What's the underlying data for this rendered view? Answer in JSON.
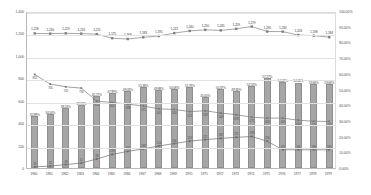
{
  "chart_data": {
    "type": "bar",
    "title": "",
    "xlabel": "",
    "ylabel": "",
    "ylim": [
      0,
      1400
    ],
    "y2lim": [
      0,
      100
    ],
    "grid": true,
    "legend": "none",
    "categories": [
      "1960",
      "1961",
      "1962",
      "1963",
      "1964",
      "1965",
      "1966",
      "1967",
      "1968",
      "1969",
      "1970",
      "1971",
      "1972",
      "1973",
      "1974",
      "1975",
      "1976",
      "1977",
      "1978",
      "1979"
    ],
    "y_left_ticks": [
      "0",
      "200",
      "400",
      "600",
      "800",
      "1,000",
      "1,200",
      "1,400"
    ],
    "y_right_ticks": [
      "0.00%",
      "10.00%",
      "20.00%",
      "30.00%",
      "40.00%",
      "50.00%",
      "60.00%",
      "70.00%",
      "80.00%",
      "90.00%",
      "100.00%"
    ],
    "series": [
      {
        "name": "Total",
        "type": "line",
        "axis": "left",
        "color": "#808080",
        "values": [
          1218,
          1216,
          1219,
          1216,
          1211,
          1175,
          1168,
          1183,
          1195,
          1221,
          1240,
          1250,
          1245,
          1259,
          1279,
          1235,
          1234,
          1203,
          1198,
          1184
        ],
        "labels": [
          "1,218",
          "1,216",
          "1,219",
          "1,216",
          "1,211",
          "1,175",
          "1,168",
          "1,183",
          "1,195",
          "1,221",
          "1,240",
          "1,250",
          "1,245",
          "1,259",
          "1,279",
          "1,235",
          "1,234",
          "1,203",
          "1,198",
          "1,184"
        ]
      },
      {
        "name": "Declining group",
        "type": "line",
        "axis": "left",
        "color": "#7a7a7a",
        "values": [
          852,
          766,
          742,
          730,
          614,
          602,
          588,
          571,
          545,
          540,
          521,
          528,
          508,
          493,
          471,
          463,
          463,
          444,
          435,
          433
        ],
        "labels": [
          "852",
          "766",
          "742",
          "730",
          "614",
          "602",
          "588",
          "571",
          "545",
          "540",
          "521",
          "528",
          "508",
          "493",
          "471",
          "463",
          "463",
          "444",
          "435",
          "433"
        ]
      },
      {
        "name": "Rising group",
        "type": "line",
        "axis": "left",
        "color": "#6e6e6e",
        "values": [
          28,
          35,
          48,
          62,
          98,
          139,
          166,
          188,
          214,
          236,
          257,
          271,
          282,
          291,
          299,
          256,
          181,
          180,
          180,
          180
        ],
        "labels": [
          "28",
          "35",
          "48",
          "62",
          "98",
          "139",
          "166",
          "188",
          "214",
          "236",
          "257",
          "271",
          "282",
          "291",
          "299",
          "256",
          "181",
          "180",
          "180",
          "180"
        ]
      },
      {
        "name": "Share",
        "type": "bar",
        "axis": "right",
        "color": "#a6a6a6",
        "values": [
          32.89,
          34.54,
          38.13,
          39.93,
          45.72,
          47.99,
          49.03,
          51.38,
          49.88,
          50.08,
          51.79,
          45.0,
          50.37,
          49.36,
          52.53,
          57.27,
          54.62,
          54.46,
          53.66,
          53.66
        ],
        "labels": [
          "32.89%",
          "34.54%",
          "38.13%",
          "39.93%",
          "45.72%",
          "47.99%",
          "49.03%",
          "51.38%",
          "49.88%",
          "50.08%",
          "51.79%",
          "45.00%",
          "50.37%",
          "49.36%",
          "52.53%",
          "57.27%",
          "54.62%",
          "54.46%",
          "53.66%",
          "53.66%"
        ]
      }
    ]
  }
}
